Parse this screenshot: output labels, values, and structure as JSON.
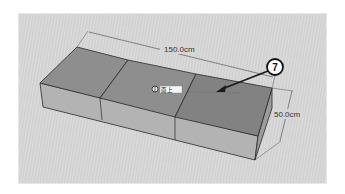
{
  "viewport": {
    "background": "#d4d4d4",
    "model": {
      "type": "box-split-into-three-segments",
      "top_face_color": "#8c8c8c",
      "top_face_selected_color": "#808080",
      "front_face_color": "#b0b0b0",
      "side_face_color": "#9a9a9a",
      "edge_color": "#2a2a2a"
    },
    "dimensions": [
      {
        "label": "150.0cm",
        "axis": "length"
      },
      {
        "label": "50.0cm",
        "axis": "width"
      }
    ],
    "cursor_tooltip": {
      "icon": "push-pull-cursor-icon",
      "text": "面上"
    },
    "callout": {
      "number": "7",
      "color": "#ffffff",
      "border": "#111111"
    }
  }
}
